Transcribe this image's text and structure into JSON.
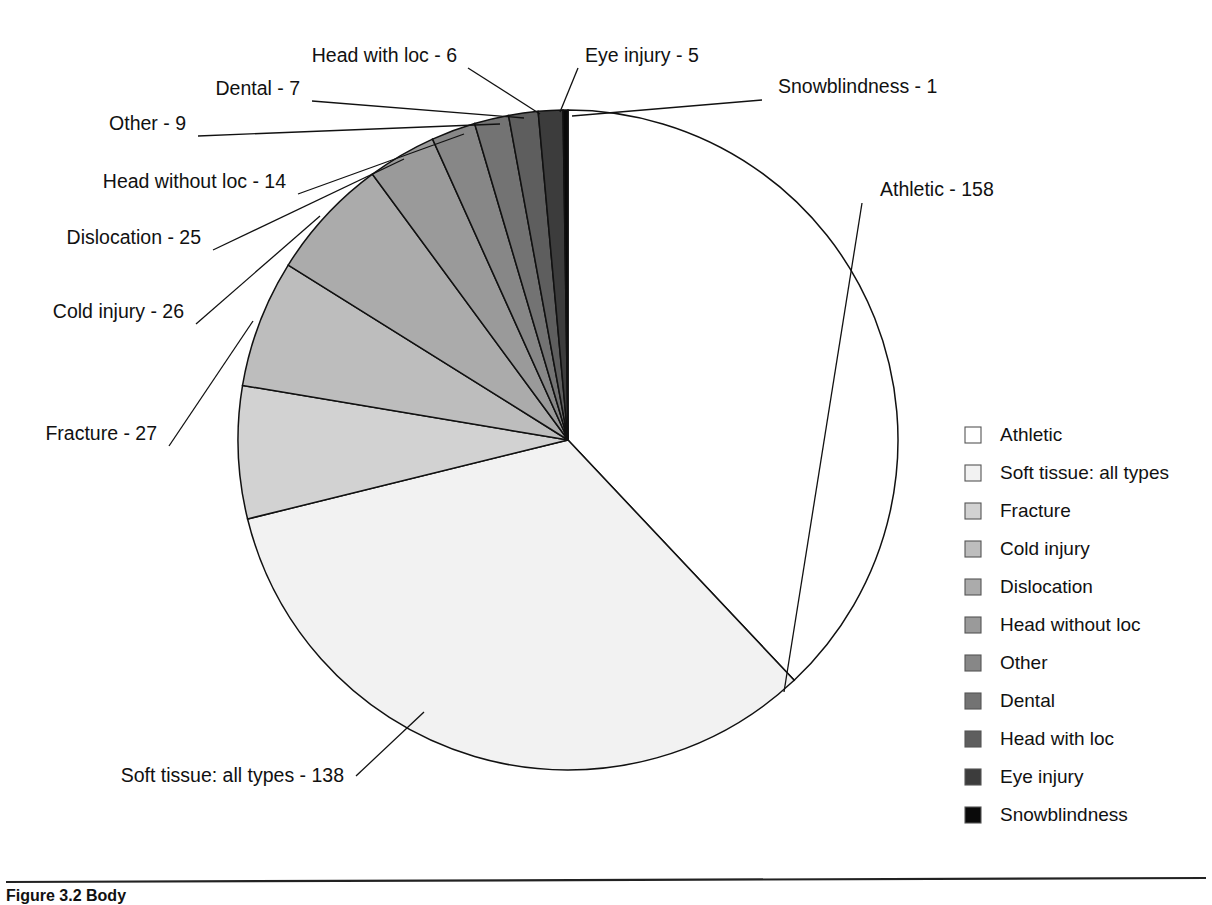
{
  "figure": {
    "caption_partial": "Figure 3.2   Body"
  },
  "chart_data": {
    "type": "pie",
    "title": "",
    "total": 416,
    "start_angle_deg": 0,
    "direction": "clockwise",
    "center": {
      "x": 568,
      "y": 440
    },
    "radius": 330,
    "legend_position": "right",
    "categories": [
      "Athletic",
      "Soft tissue: all types",
      "Fracture",
      "Cold injury",
      "Dislocation",
      "Head without loc",
      "Other",
      "Dental",
      "Head with loc",
      "Eye injury",
      "Snowblindness"
    ],
    "values": [
      158,
      138,
      27,
      26,
      25,
      14,
      9,
      7,
      6,
      5,
      1
    ],
    "colors": [
      "#ffffff",
      "#f2f2f2",
      "#d2d2d2",
      "#bdbdbd",
      "#ababab",
      "#9a9a9a",
      "#878787",
      "#737373",
      "#5e5e5e",
      "#3c3c3c",
      "#0a0a0a"
    ],
    "callouts": [
      {
        "label": "Athletic - 158",
        "text_x": 880,
        "text_y": 196,
        "anchor": "start",
        "elbow_x": 862,
        "elbow_y": 203,
        "tip_x": 784,
        "tip_y": 692
      },
      {
        "label": "Snowblindness - 1",
        "text_x": 778,
        "text_y": 93,
        "anchor": "start",
        "elbow_x": 762,
        "elbow_y": 100,
        "tip_x": 572,
        "tip_y": 116
      },
      {
        "label": "Eye injury - 5",
        "text_x": 585,
        "text_y": 62,
        "anchor": "start",
        "elbow_x": 578,
        "elbow_y": 68,
        "tip_x": 560,
        "tip_y": 112
      },
      {
        "label": "Head with loc - 6",
        "text_x": 457,
        "text_y": 62,
        "anchor": "end",
        "elbow_x": 468,
        "elbow_y": 68,
        "tip_x": 540,
        "tip_y": 114
      },
      {
        "label": "Dental - 7",
        "text_x": 300,
        "text_y": 95,
        "anchor": "end",
        "elbow_x": 312,
        "elbow_y": 101,
        "tip_x": 524,
        "tip_y": 118
      },
      {
        "label": "Other - 9",
        "text_x": 186,
        "text_y": 130,
        "anchor": "end",
        "elbow_x": 198,
        "elbow_y": 136,
        "tip_x": 500,
        "tip_y": 124
      },
      {
        "label": "Head without loc - 14",
        "text_x": 286,
        "text_y": 188,
        "anchor": "end",
        "elbow_x": 298,
        "elbow_y": 194,
        "tip_x": 464,
        "tip_y": 134
      },
      {
        "label": "Dislocation - 25",
        "text_x": 201,
        "text_y": 244,
        "anchor": "end",
        "elbow_x": 213,
        "elbow_y": 250,
        "tip_x": 404,
        "tip_y": 159
      },
      {
        "label": "Cold injury - 26",
        "text_x": 184,
        "text_y": 318,
        "anchor": "end",
        "elbow_x": 196,
        "elbow_y": 324,
        "tip_x": 320,
        "tip_y": 216
      },
      {
        "label": "Fracture - 27",
        "text_x": 157,
        "text_y": 440,
        "anchor": "end",
        "elbow_x": 169,
        "elbow_y": 446,
        "tip_x": 253,
        "tip_y": 321
      },
      {
        "label": "Soft tissue: all types - 138",
        "text_x": 344,
        "text_y": 782,
        "anchor": "end",
        "elbow_x": 356,
        "elbow_y": 776,
        "tip_x": 424,
        "tip_y": 712
      }
    ],
    "legend": {
      "swatch_x": 965,
      "swatch_size": 16,
      "label_x": 1000,
      "first_y": 441,
      "row_height": 38,
      "entries": [
        {
          "label": "Athletic",
          "color": "#ffffff"
        },
        {
          "label": "Soft tissue: all types",
          "color": "#f2f2f2"
        },
        {
          "label": "Fracture",
          "color": "#d2d2d2"
        },
        {
          "label": "Cold injury",
          "color": "#bdbdbd"
        },
        {
          "label": "Dislocation",
          "color": "#ababab"
        },
        {
          "label": "Head without loc",
          "color": "#9a9a9a"
        },
        {
          "label": "Other",
          "color": "#878787"
        },
        {
          "label": "Dental",
          "color": "#737373"
        },
        {
          "label": "Head with loc",
          "color": "#5e5e5e"
        },
        {
          "label": "Eye injury",
          "color": "#3c3c3c"
        },
        {
          "label": "Snowblindness",
          "color": "#0a0a0a"
        }
      ]
    }
  }
}
